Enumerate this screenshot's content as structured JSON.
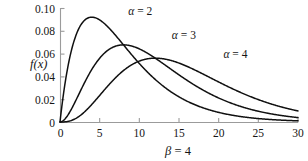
{
  "chart_data": {
    "type": "line",
    "title": "",
    "xlabel": "β = 4",
    "ylabel": "f(x)",
    "xlim": [
      0,
      30
    ],
    "ylim": [
      0,
      0.1
    ],
    "grid": false,
    "legend_position": "inline-annotations",
    "x_ticks": [
      "0",
      "5",
      "10",
      "15",
      "20",
      "25",
      "30"
    ],
    "x_tick_values": [
      0,
      5,
      10,
      15,
      20,
      25,
      30
    ],
    "y_ticks": [
      "0",
      "0.02",
      "0.04",
      "0.06",
      "0.08",
      "0.10"
    ],
    "y_tick_values": [
      0,
      0.02,
      0.04,
      0.06,
      0.08,
      0.1
    ],
    "distribution": "gamma",
    "beta": 4,
    "series": [
      {
        "name": "α = 2",
        "alpha": 2,
        "label": "α = 2",
        "label_x": 8.6,
        "label_y": 0.0935,
        "peak_x": 4,
        "peak_y": 0.092,
        "value_at_30": 0.0015,
        "x": [
          0,
          1,
          2,
          3,
          4,
          5,
          6,
          7,
          8,
          9,
          10,
          12,
          14,
          16,
          18,
          20,
          22,
          25,
          30
        ],
        "values": [
          0,
          0.0486,
          0.0758,
          0.0886,
          0.092,
          0.0895,
          0.0837,
          0.076,
          0.0677,
          0.0593,
          0.0513,
          0.0373,
          0.0261,
          0.0179,
          0.012,
          0.0079,
          0.0051,
          0.0026,
          0.00076
        ]
      },
      {
        "name": "α = 3",
        "alpha": 3,
        "label": "α = 3",
        "label_x": 14.1,
        "label_y": 0.0725,
        "peak_x": 8,
        "peak_y": 0.0677,
        "value_at_30": 0.004,
        "x": [
          0,
          1,
          2,
          3,
          4,
          5,
          6,
          7,
          8,
          9,
          10,
          12,
          14,
          16,
          18,
          20,
          22,
          25,
          30
        ],
        "values": [
          0,
          0.0061,
          0.0189,
          0.0332,
          0.046,
          0.0559,
          0.0628,
          0.0665,
          0.0677,
          0.0667,
          0.0641,
          0.056,
          0.0456,
          0.0357,
          0.0271,
          0.0198,
          0.014,
          0.0081,
          0.0028
        ]
      },
      {
        "name": "α = 4",
        "alpha": 4,
        "label": "α = 4",
        "label_x": 20.6,
        "label_y": 0.0565,
        "peak_x": 12,
        "peak_y": 0.0549,
        "value_at_30": 0.0065,
        "x": [
          0,
          1,
          2,
          3,
          4,
          5,
          6,
          7,
          8,
          9,
          10,
          12,
          14,
          16,
          18,
          20,
          22,
          25,
          30
        ],
        "values": [
          0,
          0.0005,
          0.0032,
          0.0083,
          0.0153,
          0.0233,
          0.0314,
          0.0388,
          0.0451,
          0.05,
          0.0534,
          0.056,
          0.0532,
          0.0476,
          0.0406,
          0.033,
          0.0257,
          0.0169,
          0.0071
        ]
      }
    ]
  },
  "axis": {
    "y_label": "f(x)",
    "x_label": "β = 4",
    "x_label_beta": "β",
    "x_label_eq": " = 4"
  },
  "colors": {
    "curve": "#101010",
    "axis": "#9b9b9b",
    "text": "#151515",
    "background": "#ffffff"
  }
}
